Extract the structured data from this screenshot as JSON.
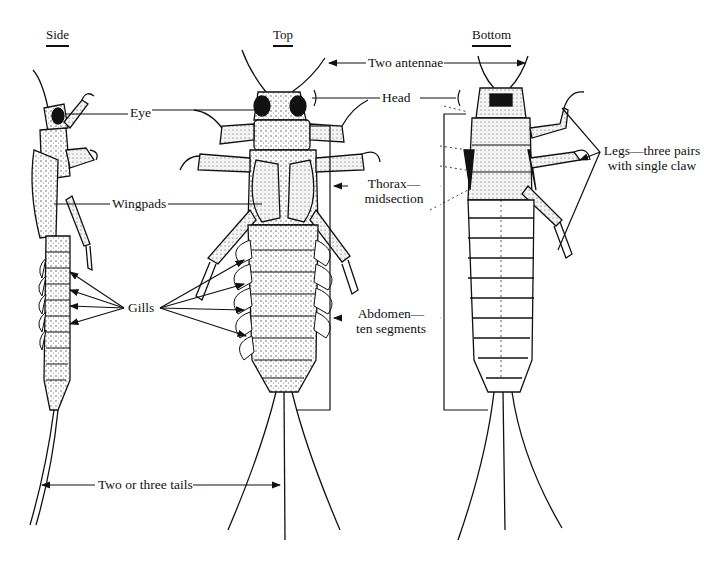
{
  "diagram": {
    "views": [
      {
        "id": "side",
        "title": "Side"
      },
      {
        "id": "top",
        "title": "Top"
      },
      {
        "id": "bottom",
        "title": "Bottom"
      }
    ],
    "labels": {
      "eye": "Eye",
      "wingpads": "Wingpads",
      "gills": "Gills",
      "two_or_three_tails": "Two or three tails",
      "two_antennae": "Two antennae",
      "head": "Head",
      "thorax_line1": "Thorax—",
      "thorax_line2": "midsection",
      "abdomen_line1": "Abdomen—",
      "abdomen_line2": "ten segments",
      "legs_line1": "Legs—three pairs",
      "legs_line2": "with single claw"
    },
    "colors": {
      "ink": "#111111",
      "stipple": "#555555",
      "paper": "#ffffff"
    }
  }
}
